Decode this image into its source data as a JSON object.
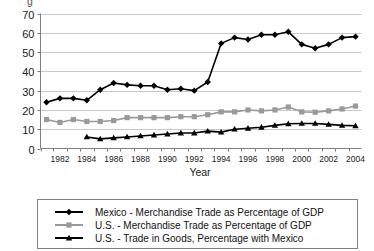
{
  "chart_data": {
    "type": "line",
    "title": "",
    "clipped_top_text": "g",
    "xlabel": "Year",
    "ylabel": "",
    "grid": true,
    "legend_position": "bottom",
    "xlim": [
      1981,
      2005
    ],
    "ylim": [
      0,
      70
    ],
    "ytick_values": [
      0,
      10,
      20,
      30,
      40,
      50,
      60,
      70
    ],
    "xtick_labels": [
      "1982",
      "1984",
      "1986",
      "1988",
      "1990",
      "1992",
      "1994",
      "1996",
      "1998",
      "2000",
      "2002",
      "2004"
    ],
    "x": [
      1981,
      1982,
      1983,
      1984,
      1985,
      1986,
      1987,
      1988,
      1989,
      1990,
      1991,
      1992,
      1993,
      1994,
      1995,
      1996,
      1997,
      1998,
      1999,
      2000,
      2001,
      2002,
      2003,
      2004
    ],
    "series": [
      {
        "name": "Mexico - Merchandise Trade as Percentage of GDP",
        "color": "#000000",
        "marker": "diamond",
        "values": [
          24,
          26,
          26,
          25,
          30.5,
          34,
          33,
          32.5,
          32.5,
          30.5,
          31,
          30,
          34.5,
          54.5,
          57.5,
          56.5,
          59,
          59,
          60.5,
          54,
          52,
          54,
          57.5,
          58
        ]
      },
      {
        "name": "U.S. - Merchandise Trade as Percentage of GDP",
        "color": "#999999",
        "marker": "square",
        "values": [
          15,
          13.5,
          15,
          14,
          14,
          14.5,
          16,
          16,
          16,
          16,
          16.5,
          16.5,
          17.5,
          19,
          19,
          20,
          19.5,
          20,
          21.5,
          19,
          18.8,
          19.5,
          20.5,
          22
        ]
      },
      {
        "name": "U.S. - Trade in Goods, Percentage with Mexico",
        "color": "#000000",
        "marker": "triangle",
        "values": [
          null,
          null,
          null,
          6,
          5,
          5.5,
          6,
          6.5,
          7,
          7.5,
          8,
          8,
          9,
          8.5,
          10,
          10.5,
          11,
          12,
          12.8,
          13,
          13,
          12.5,
          12,
          11.8
        ]
      }
    ]
  },
  "legend": {
    "items": [
      {
        "label": "Mexico - Merchandise Trade as Percentage of GDP",
        "marker": "diamond",
        "color": "#000000"
      },
      {
        "label": "U.S. - Merchandise Trade as Percentage of GDP",
        "marker": "square",
        "color": "#999999"
      },
      {
        "label": "U.S. - Trade in Goods, Percentage with Mexico",
        "marker": "triangle",
        "color": "#000000"
      }
    ]
  }
}
